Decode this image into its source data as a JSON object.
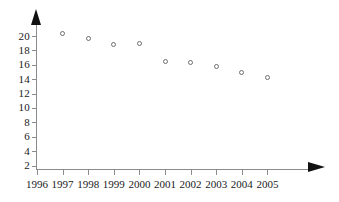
{
  "chart_data": {
    "type": "scatter",
    "title": "",
    "subtitle": "",
    "xlabel": "",
    "ylabel": "",
    "categories": [
      "1996",
      "1997",
      "1998",
      "1999",
      "2000",
      "2001",
      "2002",
      "2003",
      "2004",
      "2005"
    ],
    "x": [
      1996,
      1997,
      1998,
      1999,
      2000,
      2001,
      2002,
      2003,
      2004,
      2005
    ],
    "values": [
      null,
      20.3,
      19.6,
      18.8,
      18.9,
      16.5,
      16.3,
      15.8,
      14.9,
      14.3
    ],
    "series": [
      {
        "name": "series-1",
        "points": [
          {
            "x": "1997",
            "y": 20.3
          },
          {
            "x": "1998",
            "y": 19.6
          },
          {
            "x": "1999",
            "y": 18.8
          },
          {
            "x": "2000",
            "y": 18.9
          },
          {
            "x": "2001",
            "y": 16.5
          },
          {
            "x": "2002",
            "y": 16.3
          },
          {
            "x": "2003",
            "y": 15.8
          },
          {
            "x": "2004",
            "y": 14.9
          },
          {
            "x": "2005",
            "y": 14.3
          }
        ]
      }
    ],
    "xtick_labels": [
      "1996",
      "1997",
      "1998",
      "1999",
      "2000",
      "2001",
      "2002",
      "2003",
      "2004",
      "2005"
    ],
    "ytick_labels": [
      "2",
      "4",
      "6",
      "8",
      "10",
      "12",
      "14",
      "16",
      "18",
      "20"
    ],
    "ytick_values": [
      2,
      4,
      6,
      8,
      10,
      12,
      14,
      16,
      18,
      20
    ],
    "ylim": [
      0,
      21.5
    ],
    "xlim": [
      1996,
      2005.8
    ],
    "grid": false,
    "legend": false,
    "legend_position": "none",
    "marker": "open-circle",
    "colors": {
      "axis": "#8c8c8c",
      "arrow": "#111111",
      "marker_edge": "#6e6e6e",
      "marker_fill": "#ffffff",
      "text": "#1a1a1a",
      "background": "#ffffff"
    }
  },
  "axes": {
    "y_axis_name": "y-axis",
    "x_axis_name": "x-axis",
    "y_arrow_name": "y-axis-arrow",
    "x_arrow_name": "x-axis-arrow"
  }
}
